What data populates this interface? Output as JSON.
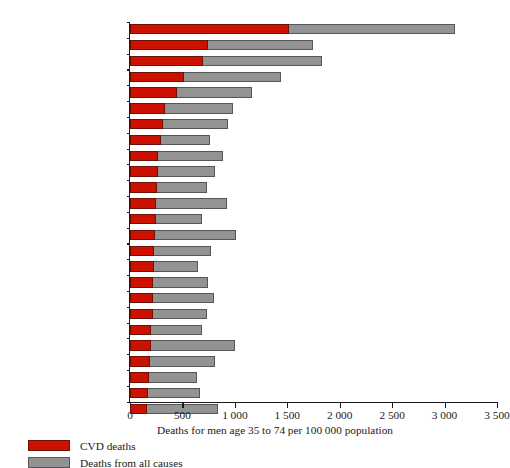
{
  "chart_data": {
    "type": "bar",
    "orientation": "horizontal",
    "stacked_overlay": true,
    "title": "",
    "xlabel": "Deaths for men age 35 to 74 per 100 000 population",
    "ylabel": "",
    "xlim": [
      0,
      3500
    ],
    "xticks": [
      0,
      500,
      1000,
      1500,
      2000,
      2500,
      3000,
      3500
    ],
    "xtick_labels": [
      "0",
      "500",
      "1 000",
      "1 500",
      "2 000",
      "2 500",
      "3 000",
      "3 500"
    ],
    "grid": false,
    "legend_position": "below-left",
    "categories": [
      "Russian Federation",
      "Romania",
      "Hungary",
      "Poland",
      "Czech Republic",
      "Scotland",
      "Finland",
      "Greece",
      "United States",
      "Germany",
      "England/Wales",
      "Portugal",
      "Ireland",
      "Mexico",
      "Netherlands",
      "Sweden",
      "Italy",
      "Austria",
      "Canada",
      "Norway",
      "Republic of Korea",
      "Spain",
      "Australia",
      "Japan",
      "France"
    ],
    "series": [
      {
        "name": "Deaths from all causes",
        "color": "#939393",
        "values": [
          3100,
          1745,
          1830,
          1440,
          1165,
          980,
          935,
          765,
          885,
          810,
          735,
          925,
          685,
          1010,
          775,
          650,
          740,
          800,
          735,
          690,
          1000,
          810,
          640,
          670,
          835
        ]
      },
      {
        "name": "CVD deaths",
        "color": "#cc1100",
        "values": [
          1520,
          745,
          700,
          515,
          450,
          335,
          315,
          295,
          270,
          265,
          260,
          250,
          245,
          235,
          230,
          225,
          220,
          220,
          215,
          205,
          200,
          195,
          185,
          170,
          165
        ]
      }
    ]
  },
  "legend": {
    "items": [
      {
        "label": "CVD deaths",
        "swatch": "cvd"
      },
      {
        "label": "Deaths from all causes",
        "swatch": "total"
      }
    ]
  }
}
